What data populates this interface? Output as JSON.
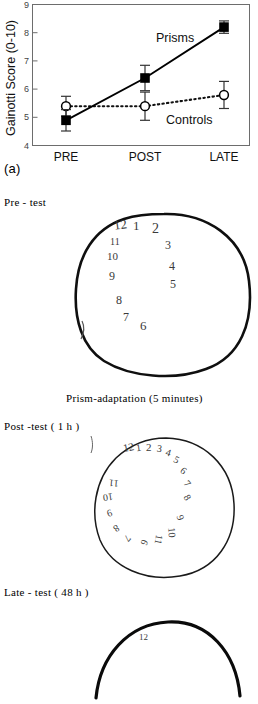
{
  "figure": {
    "panel_label": "(a)"
  },
  "chart_data": {
    "type": "line",
    "title": "",
    "xlabel": "",
    "ylabel": "Gainotti Score (0-10)",
    "categories": [
      "PRE",
      "POST",
      "LATE"
    ],
    "ylim": [
      4,
      9
    ],
    "yticks": [
      4,
      5,
      6,
      7,
      8,
      9
    ],
    "grid": false,
    "legend_position": "inline-annotation",
    "series": [
      {
        "name": "Prisms",
        "values": [
          4.7,
          6.2,
          8.0
        ],
        "errors": [
          0.38,
          0.45,
          0.22
        ],
        "marker": "filled-square",
        "line_style": "solid",
        "color": "#000000"
      },
      {
        "name": "Controls",
        "values": [
          5.2,
          5.2,
          5.6
        ],
        "errors": [
          0.35,
          0.5,
          0.48
        ],
        "marker": "open-circle",
        "line_style": "dotted",
        "color": "#000000"
      }
    ],
    "annotations": [
      {
        "text": "Prisms",
        "x": 1.42,
        "y": 7.05
      },
      {
        "text": "Controls",
        "x": 1.62,
        "y": 4.82
      }
    ]
  },
  "clock_tests": {
    "pre": {
      "label": "Pre - test",
      "numbers": [
        {
          "text": "12",
          "x": 46,
          "y": 8,
          "size": 13,
          "rot": -8
        },
        {
          "text": "1",
          "x": 65,
          "y": 9,
          "size": 13,
          "rot": 0
        },
        {
          "text": "2",
          "x": 84,
          "y": 12,
          "size": 14,
          "rot": 0
        },
        {
          "text": "3",
          "x": 97,
          "y": 29,
          "size": 12,
          "rot": 0
        },
        {
          "text": "4",
          "x": 101,
          "y": 50,
          "size": 12,
          "rot": 0
        },
        {
          "text": "5",
          "x": 102,
          "y": 68,
          "size": 12,
          "rot": 0
        },
        {
          "text": "6",
          "x": 72,
          "y": 109,
          "size": 13,
          "rot": 0
        },
        {
          "text": "7",
          "x": 55,
          "y": 101,
          "size": 12,
          "rot": 0
        },
        {
          "text": "8",
          "x": 48,
          "y": 84,
          "size": 12,
          "rot": 0
        },
        {
          "text": "9",
          "x": 41,
          "y": 60,
          "size": 12,
          "rot": 0
        },
        {
          "text": "10",
          "x": 39,
          "y": 41,
          "size": 11,
          "rot": 0
        },
        {
          "text": "11",
          "x": 42,
          "y": 27,
          "size": 10,
          "rot": 0
        }
      ]
    },
    "prism_adaptation": {
      "label": "Prism-adaptation (5 minutes)"
    },
    "post": {
      "label": "Post -test ( 1 h )",
      "numbers": [
        {
          "text": "12",
          "x": 35,
          "y": 7,
          "size": 11,
          "rot": -12
        },
        {
          "text": "1",
          "x": 48,
          "y": 8,
          "size": 10,
          "rot": -8
        },
        {
          "text": "2",
          "x": 58,
          "y": 7,
          "size": 11,
          "rot": 0
        },
        {
          "text": "3",
          "x": 69,
          "y": 9,
          "size": 10,
          "rot": 8
        },
        {
          "text": "4",
          "x": 78,
          "y": 13,
          "size": 10,
          "rot": 18
        },
        {
          "text": "5",
          "x": 86,
          "y": 20,
          "size": 10,
          "rot": 28
        },
        {
          "text": "6",
          "x": 93,
          "y": 31,
          "size": 10,
          "rot": 38
        },
        {
          "text": "7",
          "x": 97,
          "y": 44,
          "size": 10,
          "rot": 48
        },
        {
          "text": "8",
          "x": 97,
          "y": 58,
          "size": 10,
          "rot": 60
        },
        {
          "text": "9",
          "x": 90,
          "y": 78,
          "size": 10,
          "rot": 72
        },
        {
          "text": "10",
          "x": 79,
          "y": 93,
          "size": 10,
          "rot": 86
        },
        {
          "text": "11",
          "x": 66,
          "y": 100,
          "size": 10,
          "rot": 100
        },
        {
          "text": "6",
          "x": 54,
          "y": 103,
          "size": 10,
          "rot": 115
        },
        {
          "text": "7",
          "x": 37,
          "y": 99,
          "size": 10,
          "rot": 130
        },
        {
          "text": "8",
          "x": 26,
          "y": 89,
          "size": 10,
          "rot": 145
        },
        {
          "text": "9",
          "x": 19,
          "y": 74,
          "size": 10,
          "rot": 160
        },
        {
          "text": "10",
          "x": 15,
          "y": 58,
          "size": 10,
          "rot": 172
        },
        {
          "text": "11",
          "x": 21,
          "y": 44,
          "size": 10,
          "rot": 185
        }
      ]
    },
    "late": {
      "label": "Late - test ( 48 h )",
      "numbers": [
        {
          "text": "12",
          "x": 47,
          "y": 20,
          "size": 9,
          "rot": 0
        }
      ]
    }
  }
}
